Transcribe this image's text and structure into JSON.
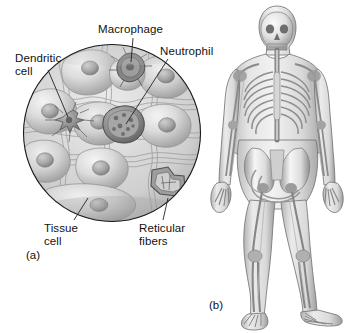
{
  "figure": {
    "kind": "anatomy-histology-figure",
    "background_color": "#ffffff",
    "text_color": "#111111",
    "panels": [
      {
        "id": "a",
        "label": "(a)",
        "kind": "circular-tissue-micrograph-illustration",
        "description": "Circular cut-away view of loose connective tissue showing tissue cells, reticular fibers, a dendritic cell, a macrophage and a neutrophil",
        "circle": {
          "cx": 112,
          "cy": 133,
          "r": 89
        }
      },
      {
        "id": "b",
        "label": "(b)",
        "kind": "human-body-skeleton-illustration",
        "description": "Full standing human body shown semi-transparent with skeleton and lymphatic structures visible"
      }
    ]
  },
  "labels": {
    "dendritic_cell": "Dendritic\ncell",
    "macrophage": "Macrophage",
    "neutrophil": "Neutrophil",
    "tissue_cell": "Tissue\ncell",
    "reticular_fibers": "Reticular\nfibers",
    "panel_a": "(a)",
    "panel_b": "(b)"
  },
  "colors": {
    "outline": "#1a1a1a",
    "leader_line": "#222222",
    "tissue_light": "#e8e8e8",
    "tissue_mid": "#c4c4c4",
    "tissue_dark": "#8e8e8e",
    "cell_nucleus": "#9a9a9a",
    "immune_cell": "#6e6e6e",
    "body_fill": "#dcdcdc",
    "bone_fill": "#f2f2f2",
    "bone_shadow": "#8a8a8a"
  }
}
